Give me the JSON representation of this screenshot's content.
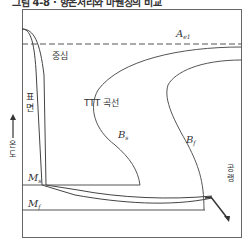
{
  "title": "그림 4-8 · 항온처리와 마퀜칭의 비교",
  "diagram": {
    "ae1_label": "A",
    "ae1_sub": "e1",
    "center_label": "중심",
    "surface_label": "표면",
    "ttt_label": "TTT 곡선",
    "bs_label": "B",
    "bs_sub": "s",
    "bf_label": "B",
    "bf_sub": "f",
    "ms_label": "M",
    "ms_sub": "s",
    "mf_label": "M",
    "mf_sub": "f",
    "y_axis_label": "온도",
    "x_axis_label": "공랭",
    "line_color": "#555555"
  }
}
